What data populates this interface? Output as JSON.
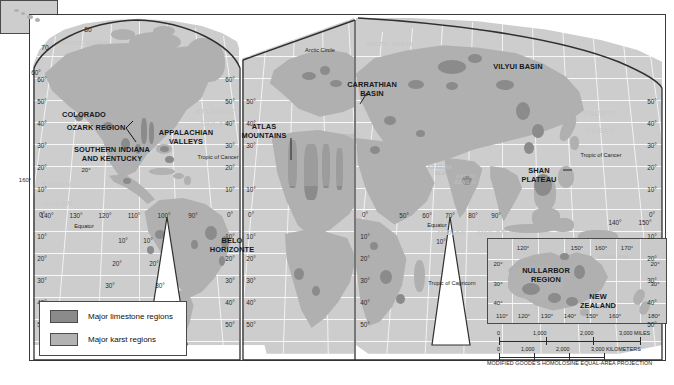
{
  "map": {
    "projection_note": "MODIFIED GOODE'S HOMOLOSINE EQUAL-AREA PROJECTION",
    "legend": {
      "items": [
        {
          "label": "Major limestone regions",
          "color": "#8b8b8b"
        },
        {
          "label": "Major karst regions",
          "color": "#b2b2b2"
        }
      ]
    },
    "region_labels": [
      {
        "name": "COLORADO",
        "x": 84,
        "y": 111
      },
      {
        "name": "OZARK REGION",
        "x": 96,
        "y": 124
      },
      {
        "name": "SOUTHERN INDIANA",
        "x": 112,
        "y": 146
      },
      {
        "name": "AND KENTUCKY",
        "x": 112,
        "y": 155
      },
      {
        "name": "APPALACHIAN",
        "x": 186,
        "y": 129
      },
      {
        "name": "VALLEYS",
        "x": 186,
        "y": 138
      },
      {
        "name": "BELO",
        "x": 232,
        "y": 237
      },
      {
        "name": "HORIZONTE",
        "x": 232,
        "y": 246
      },
      {
        "name": "ATLAS",
        "x": 264,
        "y": 123
      },
      {
        "name": "MOUNTAINS",
        "x": 264,
        "y": 132
      },
      {
        "name": "CARRATHIAN",
        "x": 372,
        "y": 81
      },
      {
        "name": "BASIN",
        "x": 372,
        "y": 90
      },
      {
        "name": "VILYUI BASIN",
        "x": 518,
        "y": 63
      },
      {
        "name": "SHAN",
        "x": 539,
        "y": 167
      },
      {
        "name": "PLATEAU",
        "x": 539,
        "y": 176
      },
      {
        "name": "NULLARBOR",
        "x": 546,
        "y": 267
      },
      {
        "name": "REGION",
        "x": 546,
        "y": 276
      },
      {
        "name": "NEW",
        "x": 598,
        "y": 293
      },
      {
        "name": "ZEALAND",
        "x": 598,
        "y": 302
      }
    ],
    "ocean_labels": [
      {
        "name": "ARCTIC OCEAN",
        "x": 84,
        "y": 41,
        "size": 5.2,
        "color": "#c6c6c6"
      },
      {
        "name": "ARCTIC OCEAN",
        "x": 390,
        "y": 42,
        "size": 5.2,
        "color": "#c6c6c6"
      },
      {
        "name": "ATLANTIC",
        "x": 215,
        "y": 108,
        "size": 7.2,
        "color": "#c9c9c9"
      },
      {
        "name": "OCEAN",
        "x": 215,
        "y": 120,
        "size": 7.2,
        "color": "#c9c9c9"
      },
      {
        "name": "PACIFIC",
        "x": 58,
        "y": 181,
        "size": 7.2,
        "color": "#c9c9c9"
      },
      {
        "name": "OCEAN",
        "x": 58,
        "y": 200,
        "size": 7.2,
        "color": "#c9c9c9"
      },
      {
        "name": "PACIFIC",
        "x": 600,
        "y": 110,
        "size": 7.2,
        "color": "#c9c9c9"
      },
      {
        "name": "OCEAN",
        "x": 600,
        "y": 127,
        "size": 7.2,
        "color": "#c9c9c9"
      },
      {
        "name": "INDIAN",
        "x": 452,
        "y": 229,
        "size": 7.2,
        "color": "#c9c9c9"
      },
      {
        "name": "OCEAN",
        "x": 492,
        "y": 229,
        "size": 7.2,
        "color": "#c9c9c9"
      },
      {
        "name": "ARABIAN",
        "x": 440,
        "y": 166,
        "size": 4.5,
        "color": "#bdbdbd"
      },
      {
        "name": "SEA",
        "x": 440,
        "y": 172,
        "size": 4.5,
        "color": "#bdbdbd"
      },
      {
        "name": "BAY OF",
        "x": 466,
        "y": 175,
        "size": 4.5,
        "color": "#bdbdbd"
      },
      {
        "name": "BENGAL",
        "x": 466,
        "y": 181,
        "size": 4.5,
        "color": "#bdbdbd"
      },
      {
        "name": "CORAL SEA",
        "x": 614,
        "y": 255,
        "size": 4.2,
        "color": "#c2c2c2"
      }
    ],
    "annotations": [
      {
        "name": "Arctic Circle",
        "x": 320,
        "y": 48
      },
      {
        "name": "Tropic of Cancer",
        "x": 218,
        "y": 155
      },
      {
        "name": "Tropic of Cancer",
        "x": 601,
        "y": 153
      },
      {
        "name": "Tropic of Capricorn",
        "x": 452,
        "y": 281
      },
      {
        "name": "Equator",
        "x": 84,
        "y": 224
      },
      {
        "name": "Equator",
        "x": 437,
        "y": 223
      }
    ],
    "lat_labels_left_lobe_left": [
      "60",
      "50",
      "40",
      "30",
      "20",
      "10",
      "0",
      "10",
      "20",
      "30",
      "40",
      "50"
    ],
    "lat_labels_left_lobe_right": [
      "60",
      "50",
      "40",
      "30",
      "20",
      "10",
      "0",
      "10",
      "20",
      "30",
      "40",
      "50"
    ],
    "lat_labels_mid_lobe": [
      "50",
      "40",
      "30",
      "10",
      "0",
      "10",
      "20",
      "30",
      "40",
      "50"
    ],
    "lat_labels_right_lobe": [
      "50",
      "40",
      "30",
      "20",
      "10",
      "0",
      "10",
      "20",
      "30",
      "40",
      "50"
    ],
    "top_lat_labels": [
      "80",
      "70"
    ],
    "lon_labels_americas": [
      "140°",
      "130°",
      "120°",
      "110°",
      "100°",
      "90°"
    ],
    "lon_labels_americas_lower": [
      "10°",
      "10°",
      "20°",
      "20°",
      "30°",
      "30°"
    ],
    "lon_labels_eurafrica": [
      "50°",
      "60°",
      "70°",
      "80°",
      "90°"
    ],
    "lon_labels_pacific_right": [
      "140°",
      "150°"
    ],
    "hawaii_inset_label": "160°",
    "hawaii_inset_lat": "20°",
    "australia_inset": {
      "lon_top": [
        "120°",
        "150°",
        "160°",
        "170°"
      ],
      "lon_bottom": [
        "110°",
        "120°",
        "130°",
        "140°",
        "150°",
        "160°",
        "180°"
      ],
      "lat_left": [
        "20°",
        "30°",
        "40°"
      ],
      "lat_right": [
        "20°",
        "30°"
      ]
    },
    "scale": {
      "miles": {
        "labels": [
          "0",
          "1,000",
          "2,000",
          "3,000 MILES"
        ]
      },
      "kilometers": {
        "labels": [
          "0",
          "1,000",
          "2,000",
          "3,000 KILOMETERS"
        ]
      }
    }
  }
}
